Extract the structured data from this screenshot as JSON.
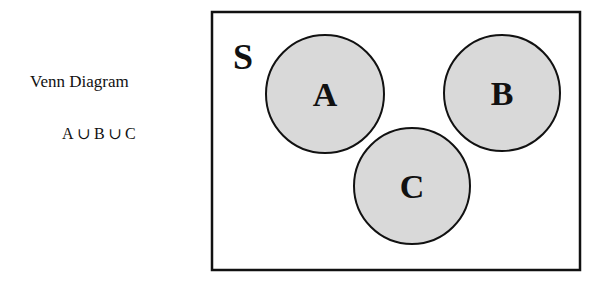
{
  "left_panel": {
    "title": "Venn Diagram",
    "formula": {
      "terms": [
        "A",
        "B",
        "C"
      ],
      "operator": "∪",
      "text": "A∪B∪C"
    }
  },
  "diagram": {
    "universe": {
      "label": "S",
      "x": 212,
      "y": 12,
      "width": 368,
      "height": 258,
      "stroke": "#111111"
    },
    "sets": [
      {
        "label": "A",
        "cx": 325,
        "cy": 94,
        "r": 59
      },
      {
        "label": "B",
        "cx": 502,
        "cy": 93,
        "r": 58
      },
      {
        "label": "C",
        "cx": 412,
        "cy": 186,
        "r": 58
      }
    ],
    "colors": {
      "set_fill": "#d9d9d9",
      "stroke": "#111111",
      "background": "#ffffff"
    }
  }
}
